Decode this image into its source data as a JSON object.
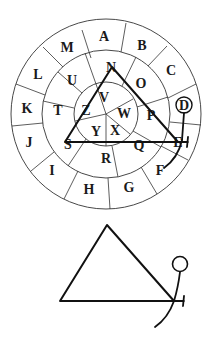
{
  "wheel": {
    "outer_ring_letters": [
      "A",
      "B",
      "C",
      "D",
      "E",
      "F",
      "G",
      "H",
      "I",
      "J",
      "K",
      "L",
      "M"
    ],
    "middle_ring_letters": [
      "N",
      "O",
      "P",
      "Q",
      "R",
      "S",
      "T",
      "U"
    ],
    "inner_ring_letters": [
      "V",
      "W",
      "X",
      "Y",
      "Z"
    ],
    "circled_letter": "D",
    "triangle_vertices": [
      "N",
      "E",
      "S"
    ]
  },
  "labels": {
    "A": "A",
    "B": "B",
    "C": "C",
    "D": "D",
    "E": "E",
    "F": "F",
    "G": "G",
    "H": "H",
    "I": "I",
    "J": "J",
    "K": "K",
    "L": "L",
    "M": "M",
    "N": "N",
    "O": "O",
    "P": "P",
    "Q": "Q",
    "R": "R",
    "S": "S",
    "T": "T",
    "U": "U",
    "V": "V",
    "W": "W",
    "X": "X",
    "Y": "Y",
    "Z": "Z"
  },
  "glyph": {
    "description": "triangle with figure (circle head, stem, arc, tick)"
  }
}
